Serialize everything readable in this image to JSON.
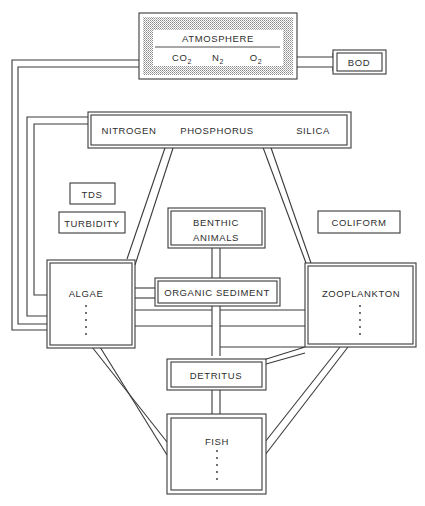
{
  "diagram": {
    "type": "aquatic ecosystem compartment model",
    "atmosphere": {
      "title": "ATMOSPHERE",
      "gases": [
        {
          "base": "CO",
          "sub": "2"
        },
        {
          "base": "N",
          "sub": "2"
        },
        {
          "base": "O",
          "sub": "2"
        }
      ]
    },
    "bod": "BOD",
    "nutrients": [
      "NITROGEN",
      "PHOSPHORUS",
      "SILICA"
    ],
    "tds": "TDS",
    "turbidity": "TURBIDITY",
    "coliform": "COLIFORM",
    "benthic": [
      "BENTHIC",
      "ANIMALS"
    ],
    "algae": "ALGAE",
    "organic_sediment": "ORGANIC SEDIMENT",
    "zooplankton": "ZOOPLANKTON",
    "detritus": "DETRITUS",
    "fish": "FISH",
    "colors": {
      "line": "#3a3a3a",
      "text": "#2e2e2e",
      "stipple": "#9a9a9a"
    }
  }
}
